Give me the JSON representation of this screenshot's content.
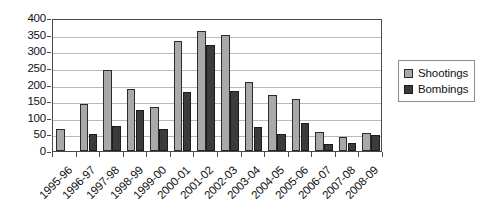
{
  "chart_data": {
    "type": "bar",
    "title": "",
    "subtitle": "",
    "xlabel": "",
    "ylabel": "",
    "ylim": [
      0,
      400
    ],
    "ytick_step": 50,
    "yticks": [
      400,
      350,
      300,
      250,
      200,
      150,
      100,
      50,
      0
    ],
    "grid": true,
    "legend_position": "right",
    "categories": [
      "1995-96",
      "1996-97",
      "1997-98",
      "1998-99",
      "1999-00",
      "2000-01",
      "2001-02",
      "2002-03",
      "2003-04",
      "2004-05",
      "2005-06",
      "2006-07",
      "2007-08",
      "2008-09"
    ],
    "series": [
      {
        "name": "Shootings",
        "color": "#a9a9a9",
        "values": [
          65,
          140,
          245,
          187,
          131,
          331,
          360,
          350,
          208,
          167,
          157,
          58,
          43,
          55
        ]
      },
      {
        "name": "Bombings",
        "color": "#3b3b3b",
        "values": [
          0,
          51,
          74,
          124,
          67,
          178,
          319,
          179,
          72,
          50,
          83,
          22,
          25,
          47
        ]
      }
    ]
  },
  "legend": {
    "items": [
      {
        "label": "Shootings",
        "swatch": "shootings"
      },
      {
        "label": "Bombings",
        "swatch": "bombings"
      }
    ]
  },
  "colors": {
    "shootings": "#a9a9a9",
    "bombings": "#3b3b3b",
    "gridline": "#b9b9b9",
    "axis": "#4a4a4a",
    "background": "#ffffff"
  }
}
